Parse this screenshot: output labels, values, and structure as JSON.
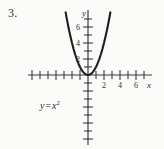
{
  "problem": {
    "number": "3."
  },
  "equation": {
    "lhs": "y",
    "operator": "=",
    "rhs_base": "x",
    "rhs_exponent": "2",
    "full": "y = x2"
  },
  "axes": {
    "x_label": "x",
    "y_label": "y"
  },
  "chart_data": {
    "type": "line",
    "title": "",
    "subtitle": "",
    "xlabel": "x",
    "ylabel": "y",
    "equation": "y = x^2",
    "xlim": [
      -7.5,
      8
    ],
    "ylim": [
      -9,
      8.5
    ],
    "grid": false,
    "legend": null,
    "x_ticks": [
      -7,
      -6,
      -5,
      -4,
      -3,
      -2,
      -1,
      1,
      2,
      3,
      4,
      5,
      6,
      7
    ],
    "x_tick_labels": [
      "",
      "",
      "",
      "",
      "",
      "",
      "",
      "",
      "2",
      "",
      "4",
      "",
      "6",
      ""
    ],
    "x_labeled_ticks": [
      2,
      4,
      6
    ],
    "y_ticks": [
      -8,
      -7,
      -6,
      -5,
      -4,
      -3,
      -2,
      -1,
      1,
      2,
      3,
      4,
      5,
      6,
      7
    ],
    "y_tick_labels": [
      "",
      "",
      "",
      "",
      "",
      "",
      "",
      "",
      "",
      "2",
      "",
      "4",
      "",
      "6",
      ""
    ],
    "y_labeled_ticks": [
      2,
      4,
      6
    ],
    "series": [
      {
        "name": "y = x^2",
        "x": [
          -2.8,
          -2.6,
          -2.4,
          -2.2,
          -2.0,
          -1.8,
          -1.6,
          -1.4,
          -1.2,
          -1.0,
          -0.8,
          -0.6,
          -0.4,
          -0.2,
          0.0,
          0.2,
          0.4,
          0.6,
          0.8,
          1.0,
          1.2,
          1.4,
          1.6,
          1.8,
          2.0,
          2.2,
          2.4,
          2.6,
          2.8
        ],
        "y": [
          7.84,
          6.76,
          5.76,
          4.84,
          4.0,
          3.24,
          2.56,
          1.96,
          1.44,
          1.0,
          0.64,
          0.36,
          0.16,
          0.04,
          0.0,
          0.04,
          0.16,
          0.36,
          0.64,
          1.0,
          1.44,
          1.96,
          2.56,
          3.24,
          4.0,
          4.84,
          5.76,
          6.76,
          7.84
        ]
      }
    ]
  }
}
